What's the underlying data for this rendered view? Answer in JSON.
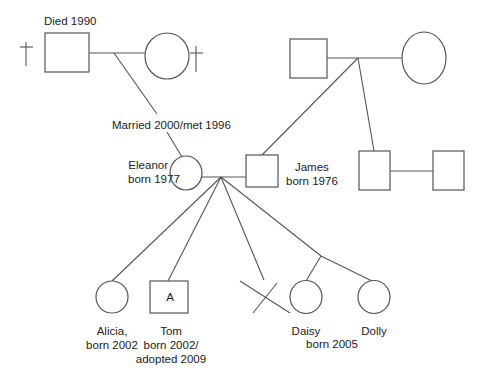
{
  "diagram": {
    "type": "genogram",
    "colors": {
      "stroke": "#555555",
      "text": "#222222",
      "background": "#ffffff"
    }
  },
  "grandparents_left": {
    "grandfather": {
      "sex": "male",
      "deceased": true,
      "note": "Died 1990"
    },
    "grandmother": {
      "sex": "female",
      "deceased": true
    },
    "marriage_label": "Married 2000/met 1996"
  },
  "grandparents_right": {
    "grandfather": {
      "sex": "male",
      "deceased": false
    },
    "grandmother": {
      "sex": "female",
      "deceased": false
    }
  },
  "parents": {
    "mother": {
      "name": "Eleanor",
      "born": "born 1977",
      "sex": "female"
    },
    "father": {
      "name": "James",
      "born": "born 1976",
      "sex": "male"
    }
  },
  "james_sibling": {
    "sex": "male",
    "partner": {
      "sex": "male"
    }
  },
  "children": [
    {
      "name": "Alicia,",
      "born": "born 2002",
      "sex": "female"
    },
    {
      "name": "Tom",
      "born": "born 2002/",
      "extra": "adopted 2009",
      "sex": "male",
      "marker": "A"
    },
    {
      "name": "",
      "type": "miscarriage / pregnancy loss",
      "symbol": "X"
    },
    {
      "name": "Daisy",
      "sex": "female",
      "twin": true
    },
    {
      "name": "Dolly",
      "sex": "female",
      "twin": true
    }
  ],
  "twins_born": "born 2005"
}
